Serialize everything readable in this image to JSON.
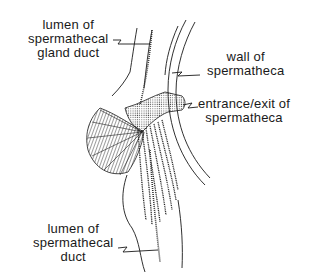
{
  "figure": {
    "stroke_color": "#1a1a1a",
    "background": "#ffffff"
  },
  "labels": {
    "gland_duct": {
      "lines": [
        "lumen of",
        "spermathecal",
        "gland duct"
      ]
    },
    "wall": {
      "lines": [
        "wall of",
        "spermatheca"
      ]
    },
    "entrance": {
      "lines": [
        "entrance/exit of",
        "spermatheca"
      ]
    },
    "duct": {
      "lines": [
        "lumen of",
        "spermathecal",
        "duct"
      ]
    }
  }
}
